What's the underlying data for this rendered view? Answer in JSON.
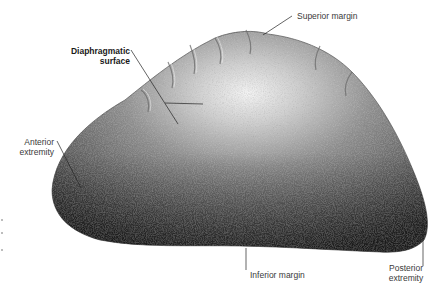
{
  "figure": {
    "background_color": "#ffffff",
    "organ_colors": {
      "highlight": "#f2f2f2",
      "mid": "#8a8a8a",
      "shadow": "#2e2e2e",
      "outline": "#3a3a3a"
    },
    "leader_line_color": "#222222"
  },
  "labels": {
    "superior_margin": "Superior margin",
    "diaphragmatic_surface_line1": "Diaphragmatic",
    "diaphragmatic_surface_line2": "surface",
    "anterior_extremity_line1": "Anterior",
    "anterior_extremity_line2": "extremity",
    "inferior_margin": "Inferior margin",
    "posterior_extremity_line1": "Posterior",
    "posterior_extremity_line2": "extremity"
  }
}
